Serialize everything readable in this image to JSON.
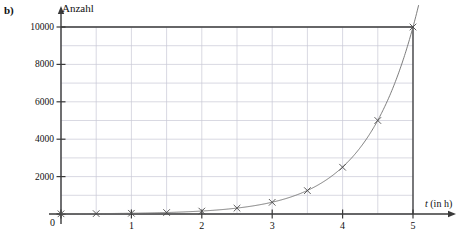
{
  "figure": {
    "part_label": "b)",
    "y_axis_title": "Anzahl",
    "x_axis_title_var": "t",
    "x_axis_title_unit": "(in h)",
    "origin_label": "0"
  },
  "colors": {
    "axis": "#3a3a3a",
    "grid": "#c9c9d6",
    "curve": "#6e6e6e",
    "marker": "#4a4a4a",
    "text": "#101010",
    "background": "#ffffff"
  },
  "chart_data": {
    "type": "line",
    "title": "",
    "subtitle": "",
    "xlabel": "t (in h)",
    "ylabel": "Anzahl",
    "xlim": [
      0,
      5
    ],
    "ylim": [
      0,
      10000
    ],
    "grid": true,
    "legend": "none",
    "x_ticks": [
      0,
      1,
      2,
      3,
      4,
      5
    ],
    "x_tick_labels": [
      "0",
      "1",
      "2",
      "3",
      "4",
      "5"
    ],
    "x_minor_step": 0.5,
    "y_ticks": [
      0,
      2000,
      4000,
      6000,
      8000,
      10000
    ],
    "y_tick_labels": [
      "0",
      "2000",
      "4000",
      "6000",
      "8000",
      "10000"
    ],
    "y_minor_step": 1000,
    "marker": "x",
    "series": [
      {
        "name": "Anzahl",
        "x": [
          0,
          0.5,
          1,
          1.5,
          2,
          2.5,
          3,
          3.5,
          4,
          4.5,
          5
        ],
        "values": [
          10,
          20,
          39,
          78,
          156,
          313,
          625,
          1250,
          2500,
          5000,
          10000
        ]
      }
    ],
    "annotations": []
  }
}
